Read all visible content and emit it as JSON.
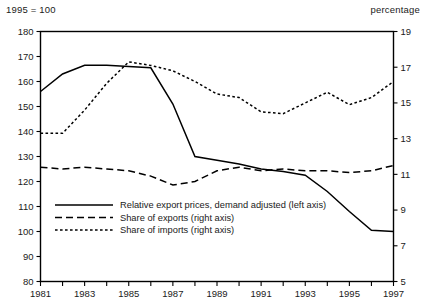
{
  "header": {
    "left_unit": "1995 = 100",
    "right_unit": "percentage"
  },
  "legend": {
    "items": [
      {
        "label": "Relative export prices, demand adjusted (left axis)",
        "style": "solid",
        "key": "relative_export_prices"
      },
      {
        "label": "Share of exports (right axis)",
        "style": "long-dash",
        "key": "share_of_exports"
      },
      {
        "label": "Share of imports (right axis)",
        "style": "short-dash",
        "key": "share_of_imports"
      }
    ]
  },
  "chart_data": {
    "type": "line",
    "title": "",
    "subtitle": "",
    "xlabel": "",
    "ylabel": "1995 = 100",
    "y2label": "percentage",
    "grid": false,
    "legend_position": "inside-lower-left",
    "x": [
      1981,
      1982,
      1983,
      1984,
      1985,
      1986,
      1987,
      1988,
      1989,
      1990,
      1991,
      1992,
      1993,
      1994,
      1995,
      1996,
      1997
    ],
    "xlim": [
      1981,
      1997
    ],
    "xticks": [
      1981,
      1982,
      1983,
      1984,
      1985,
      1986,
      1987,
      1988,
      1989,
      1990,
      1991,
      1992,
      1993,
      1994,
      1995,
      1996,
      1997
    ],
    "xticklabels": [
      "1981",
      "",
      "1983",
      "",
      "1985",
      "",
      "1987",
      "",
      "1989",
      "",
      "1991",
      "",
      "1993",
      "",
      "1995",
      "",
      "1997"
    ],
    "ylim": [
      80,
      180
    ],
    "yticks": [
      80,
      90,
      100,
      110,
      120,
      130,
      140,
      150,
      160,
      170,
      180
    ],
    "yticklabels": [
      "80",
      "90",
      "100",
      "110",
      "120",
      "130",
      "140",
      "150",
      "160",
      "170",
      "180"
    ],
    "y2lim": [
      5,
      19
    ],
    "y2ticks": [
      5,
      7,
      9,
      11,
      13,
      15,
      17,
      19
    ],
    "y2ticklabels": [
      "5",
      "7",
      "9",
      "11",
      "13",
      "15",
      "17",
      "19"
    ],
    "series": [
      {
        "name": "Relative export prices, demand adjusted (left axis)",
        "axis": "left",
        "style": "solid",
        "values": [
          156,
          163,
          166.5,
          166.5,
          166,
          165.5,
          151,
          130,
          128.5,
          127,
          125,
          124,
          122.5,
          116,
          108,
          100.5,
          100
        ]
      },
      {
        "name": "Share of exports (right axis)",
        "axis": "right",
        "style": "long-dash",
        "values": [
          11.4,
          11.3,
          11.4,
          11.3,
          11.2,
          10.9,
          10.4,
          10.6,
          11.2,
          11.4,
          11.2,
          11.3,
          11.2,
          11.2,
          11.1,
          11.2,
          11.5
        ]
      },
      {
        "name": "Share of imports (right axis)",
        "axis": "right",
        "style": "short-dash",
        "values": [
          13.3,
          13.3,
          14.6,
          16.1,
          17.3,
          17.1,
          16.8,
          16.2,
          15.5,
          15.3,
          14.5,
          14.4,
          15.0,
          15.6,
          14.9,
          15.3,
          16.2
        ]
      }
    ]
  }
}
